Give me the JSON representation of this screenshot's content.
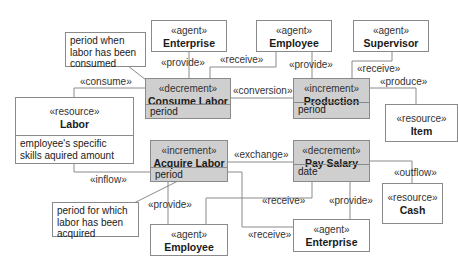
{
  "diagram": {
    "classes": [
      {
        "id": "enterprise_top",
        "stereotype": "«agent»",
        "name": "Enterprise"
      },
      {
        "id": "employee_top",
        "stereotype": "«agent»",
        "name": "Employee"
      },
      {
        "id": "supervisor",
        "stereotype": "«agent»",
        "name": "Supervisor"
      },
      {
        "id": "consume_labor",
        "stereotype": "«decrement»",
        "name": "Consume Labor",
        "attribute": "period"
      },
      {
        "id": "production",
        "stereotype": "«increment»",
        "name": "Production",
        "attribute": "period"
      },
      {
        "id": "item",
        "stereotype": "«resource»",
        "name": "Item"
      },
      {
        "id": "labor",
        "stereotype": "«resource»",
        "name": "Labor",
        "attribute": "employee's specific skills aquired amount"
      },
      {
        "id": "acquire_labor",
        "stereotype": "«increment»",
        "name": "Acquire Labor",
        "attribute": "period"
      },
      {
        "id": "pay_salary",
        "stereotype": "«decrement»",
        "name": "Pay Salary",
        "attribute": "date"
      },
      {
        "id": "cash",
        "stereotype": "«resource»",
        "name": "Cash"
      },
      {
        "id": "employee_bottom",
        "stereotype": "«agent»",
        "name": "Employee"
      },
      {
        "id": "enterprise_bottom",
        "stereotype": "«agent»",
        "name": "Enterprise"
      }
    ],
    "notes": [
      {
        "id": "note_consumed",
        "text": "period when labor has been consumed"
      },
      {
        "id": "note_acquired",
        "text": "period for which labor has been acquired"
      }
    ],
    "associations": [
      {
        "label": "«provide»",
        "from": "Enterprise",
        "to": "Consume Labor"
      },
      {
        "label": "«receive»",
        "from": "Employee",
        "to": "Consume Labor"
      },
      {
        "label": "«provide»",
        "from": "Employee",
        "to": "Production"
      },
      {
        "label": "«receive»",
        "from": "Supervisor",
        "to": "Production"
      },
      {
        "label": "«produce»",
        "from": "Production",
        "to": "Item"
      },
      {
        "label": "«consume»",
        "from": "Consume Labor",
        "to": "Labor"
      },
      {
        "label": "«conversion»",
        "from": "Consume Labor",
        "to": "Production"
      },
      {
        "label": "«exchange»",
        "from": "Acquire Labor",
        "to": "Pay Salary"
      },
      {
        "label": "«inflow»",
        "from": "Labor",
        "to": "Acquire Labor"
      },
      {
        "label": "«outflow»",
        "from": "Pay Salary",
        "to": "Cash"
      },
      {
        "label": "«provide»",
        "from": "Employee",
        "to": "Acquire Labor"
      },
      {
        "label": "«receive»",
        "from": "Employee",
        "to": "Pay Salary"
      },
      {
        "label": "«provide»",
        "from": "Enterprise",
        "to": "Pay Salary"
      },
      {
        "label": "«receive»",
        "from": "Enterprise",
        "to": "Acquire Labor"
      }
    ]
  }
}
